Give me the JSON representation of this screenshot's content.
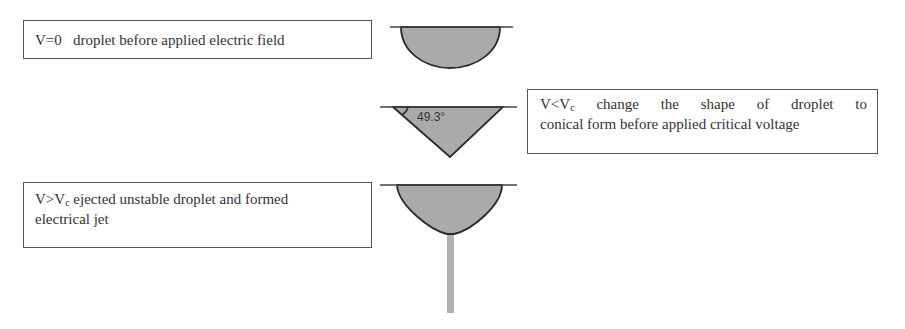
{
  "stage1": {
    "label_prefix": "V=0",
    "label_text": "droplet before applied electric field"
  },
  "stage2": {
    "label_v": "V<V",
    "label_sub": "c",
    "line1_rest": " change the shape of droplet to",
    "line2": "conical form before applied critical voltage",
    "angle_label": "49.3°"
  },
  "stage3": {
    "label_v": "V>V",
    "label_sub": "c",
    "line1_rest": " ejected unstable droplet and formed",
    "line2": "electrical jet"
  },
  "colors": {
    "droplet_fill": "#aaaaaa",
    "outline": "#2a2a2a",
    "jet": "#b0b0b0"
  }
}
